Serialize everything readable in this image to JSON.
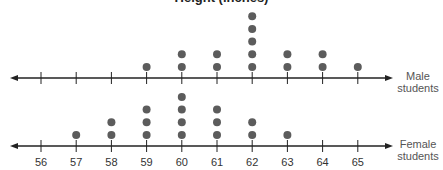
{
  "chart_data": {
    "type": "dot-plot",
    "title": "Height (inches)",
    "xlabel": "",
    "ylabel": "",
    "categories": [
      56,
      57,
      58,
      59,
      60,
      61,
      62,
      63,
      64,
      65
    ],
    "xlim": [
      56,
      65
    ],
    "grid": false,
    "series": [
      {
        "name": "Male students",
        "values": [
          0,
          0,
          0,
          1,
          2,
          2,
          5,
          2,
          2,
          1
        ]
      },
      {
        "name": "Female students",
        "values": [
          0,
          1,
          2,
          3,
          4,
          3,
          2,
          1,
          0,
          0
        ]
      }
    ]
  },
  "labels": {
    "title": "Height (inches)",
    "male_line1": "Male",
    "male_line2": "students",
    "female_line1": "Female",
    "female_line2": "students"
  },
  "colors": {
    "dot": "#5c5c5c",
    "axis": "#222222"
  }
}
